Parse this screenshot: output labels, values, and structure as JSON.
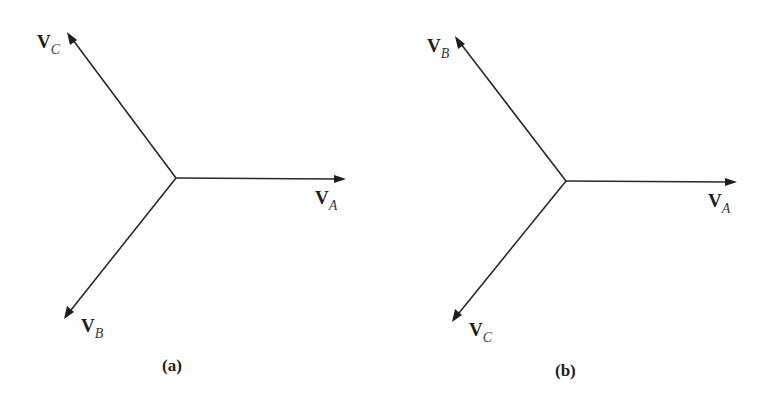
{
  "diagram": {
    "panels": [
      {
        "caption": "(a)",
        "phasors": [
          {
            "name": "V",
            "subscript": "A",
            "angle_deg": 0
          },
          {
            "name": "V",
            "subscript": "C",
            "angle_deg": 120
          },
          {
            "name": "V",
            "subscript": "B",
            "angle_deg": 240
          }
        ]
      },
      {
        "caption": "(b)",
        "phasors": [
          {
            "name": "V",
            "subscript": "A",
            "angle_deg": 0
          },
          {
            "name": "V",
            "subscript": "B",
            "angle_deg": 120
          },
          {
            "name": "V",
            "subscript": "C",
            "angle_deg": 240
          }
        ]
      }
    ]
  }
}
